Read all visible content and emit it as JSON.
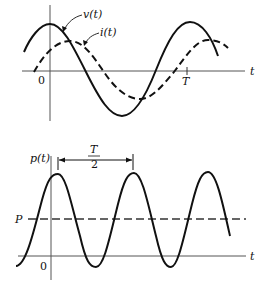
{
  "top_plot": {
    "curve_v_label": "v(t)",
    "curve_i_label": "i(t)",
    "x_axis_label": "t",
    "origin_label": "0",
    "period_tick_label": "T"
  },
  "bottom_plot": {
    "y_axis_label": "p(t)",
    "x_axis_label": "t",
    "origin_label": "0",
    "average_label": "P",
    "half_period_numerator": "T",
    "half_period_denominator": "2"
  },
  "colors": {
    "ink": "#111111",
    "axis": "#555555"
  }
}
